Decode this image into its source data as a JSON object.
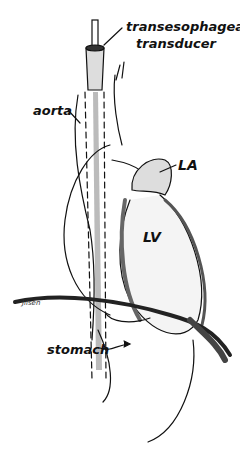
{
  "figure": {
    "type": "anatomical illustration",
    "labels": {
      "transducer_line1": "transesophageal",
      "transducer_line2": "transducer",
      "aorta": "aorta",
      "left_atrium": "LA",
      "left_ventricle": "LV",
      "stomach": "stomach"
    },
    "signature": "Jilsen",
    "colors": {
      "ink": "#111111",
      "background": "#ffffff",
      "shading": "#888888"
    }
  }
}
